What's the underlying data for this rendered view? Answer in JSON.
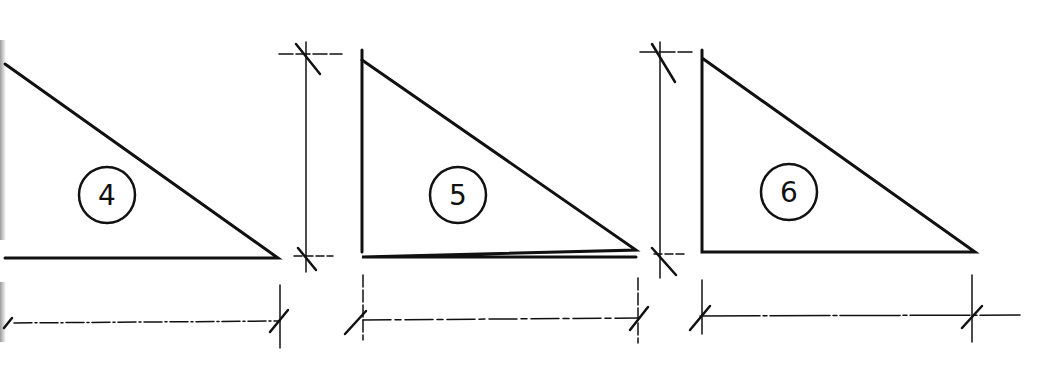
{
  "diagram": {
    "title": "",
    "stroke_color": "#111111",
    "background": "#ffffff",
    "triangles": [
      {
        "id": "triangle-4",
        "label": "4",
        "right_angle": "bottom-left (clipped at left edge)",
        "points": [
          [
            5,
            64
          ],
          [
            278,
            258
          ],
          [
            5,
            258
          ]
        ],
        "label_center": [
          107,
          195
        ],
        "label_radius": 28,
        "dimensions": {
          "height": "",
          "width": ""
        }
      },
      {
        "id": "triangle-5",
        "label": "5",
        "right_angle": "bottom-left",
        "points": [
          [
            362,
            60
          ],
          [
            636,
            257
          ],
          [
            362,
            257
          ]
        ],
        "label_center": [
          458,
          195
        ],
        "label_radius": 28,
        "dimensions": {
          "height": "",
          "width": ""
        }
      },
      {
        "id": "triangle-6",
        "label": "6",
        "right_angle": "bottom-left",
        "points": [
          [
            702,
            58
          ],
          [
            975,
            252
          ],
          [
            702,
            252
          ]
        ],
        "label_center": [
          789,
          192
        ],
        "label_radius": 28,
        "dimensions": {
          "height": "",
          "width": ""
        }
      }
    ]
  }
}
